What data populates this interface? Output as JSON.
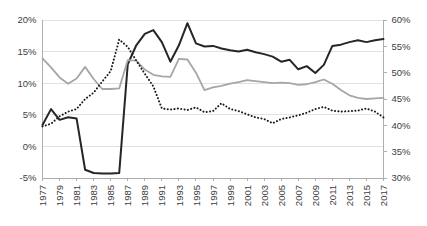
{
  "chart_data": {
    "type": "line",
    "title": "",
    "subtitle": "",
    "xlabel": "",
    "ylabel": "",
    "y2label": "",
    "grid": true,
    "legend": "none",
    "x": [
      1977,
      1978,
      1979,
      1980,
      1981,
      1982,
      1983,
      1984,
      1985,
      1986,
      1987,
      1988,
      1989,
      1990,
      1991,
      1992,
      1993,
      1994,
      1995,
      1996,
      1997,
      1998,
      1999,
      2000,
      2001,
      2002,
      2003,
      2004,
      2005,
      2006,
      2007,
      2008,
      2009,
      2010,
      2011,
      2012,
      2013,
      2014,
      2015,
      2016,
      2017
    ],
    "x_tick_labels": [
      "1977",
      "1979",
      "1981",
      "1983",
      "1985",
      "1987",
      "1989",
      "1991",
      "1993",
      "1995",
      "1997",
      "1999",
      "2001",
      "2003",
      "2005",
      "2007",
      "2009",
      "2011",
      "2013",
      "2015",
      "2017"
    ],
    "x_tick_step": 2,
    "xlim": [
      1977,
      2017
    ],
    "ylim": [
      -5,
      20
    ],
    "y_ticks": [
      -5,
      0,
      5,
      10,
      15,
      20
    ],
    "y_tick_labels": [
      "-5%",
      "0%",
      "5%",
      "10%",
      "15%",
      "20%"
    ],
    "y2lim": [
      30,
      60
    ],
    "y2_ticks": [
      30,
      35,
      40,
      45,
      50,
      55,
      60
    ],
    "y2_tick_labels": [
      "30%",
      "35%",
      "40%",
      "45%",
      "50%",
      "55%",
      "60%"
    ],
    "series": [
      {
        "name": "solid-black-series",
        "axis": "left",
        "style": "solid",
        "color": "#262626",
        "width": 2.0,
        "values": [
          3.4,
          5.9,
          4.2,
          4.6,
          4.4,
          -3.7,
          -4.2,
          -4.3,
          -4.3,
          -4.2,
          13.0,
          16.0,
          17.8,
          18.4,
          16.5,
          13.4,
          16.0,
          19.5,
          16.3,
          15.8,
          15.9,
          15.5,
          15.2,
          15.0,
          15.3,
          14.9,
          14.6,
          14.2,
          13.4,
          13.7,
          12.2,
          12.7,
          11.6,
          12.9,
          15.9,
          16.1,
          16.5,
          16.8,
          16.5,
          16.8,
          17.0
        ]
      },
      {
        "name": "gray-series",
        "axis": "right",
        "style": "solid",
        "color": "#a6a6a6",
        "width": 1.8,
        "values": [
          52.7,
          51.0,
          49.1,
          47.9,
          48.9,
          51.1,
          48.8,
          46.9,
          46.9,
          47.0,
          52.4,
          52.3,
          50.6,
          49.6,
          49.3,
          49.2,
          52.6,
          52.5,
          50.0,
          46.7,
          47.2,
          47.5,
          47.9,
          48.2,
          48.6,
          48.4,
          48.2,
          48.0,
          48.1,
          48.0,
          47.7,
          47.8,
          48.2,
          48.7,
          47.9,
          46.7,
          45.7,
          45.2,
          45.0,
          45.1,
          45.2
        ]
      },
      {
        "name": "dotted-black-series",
        "axis": "right",
        "style": "dotted",
        "color": "#1a1a1a",
        "width": 2.0,
        "values": [
          39.8,
          40.3,
          41.7,
          42.6,
          43.1,
          45.0,
          46.2,
          48.3,
          50.3,
          56.3,
          54.9,
          52.3,
          49.8,
          47.4,
          43.2,
          43.0,
          43.2,
          42.9,
          43.4,
          42.5,
          42.7,
          44.2,
          43.1,
          42.7,
          42.1,
          41.5,
          41.2,
          40.4,
          41.2,
          41.5,
          41.9,
          42.4,
          43.1,
          43.5,
          42.8,
          42.6,
          42.7,
          42.8,
          43.2,
          42.6,
          41.5
        ]
      }
    ]
  },
  "axes": {
    "left_axis_name": "left-percentage-axis",
    "right_axis_name": "right-percentage-axis",
    "bottom_axis_name": "year-axis"
  }
}
